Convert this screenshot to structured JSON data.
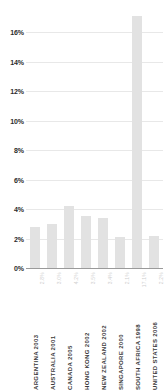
{
  "chart_data": {
    "type": "bar",
    "title": "",
    "subtitle": "",
    "xlabel": "",
    "ylabel": "",
    "ylim": [
      0,
      17.5
    ],
    "grid": true,
    "legend": null,
    "bar_color": "#e2e2e2",
    "gridline_color": "#e8e8e8",
    "baseline_color": "#9a9a9a",
    "axis_text_color": "#2b2b2b",
    "value_label_color": "#cfcfcf",
    "categories": [
      "ARGENTINA 2003",
      "AUSTRALIA 2001",
      "CANADA 2005",
      "HONG KONG 2002",
      "NEW ZEALAND 2002",
      "SINGAPORE 2000",
      "SOUTH AFRICA 1998",
      "UNITED STATES 2006"
    ],
    "values": [
      2.8,
      3.0,
      4.2,
      3.5,
      3.4,
      2.1,
      17.1,
      2.2
    ],
    "value_labels": [
      "2.8%",
      "3.0%",
      "4.2%",
      "3.5%",
      "3.4%",
      "2.1%",
      "17.1%",
      "2.2%"
    ],
    "yticks": [
      0,
      2,
      4,
      6,
      8,
      10,
      12,
      14,
      16
    ],
    "ytick_labels": [
      "0%",
      "2%",
      "4%",
      "6%",
      "8%",
      "10%",
      "12%",
      "14%",
      "16%"
    ]
  }
}
